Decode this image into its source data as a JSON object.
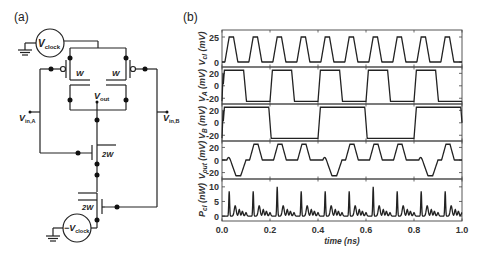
{
  "panel_a": {
    "label": "(a)",
    "source_top": "V",
    "source_top_sub": "clock",
    "source_bottom": "−V",
    "source_bottom_sub": "clock",
    "pmos_left_width": "W",
    "pmos_right_width": "W",
    "output_label": "V",
    "output_sub": "out",
    "input_a": "V",
    "input_a_sub": "in,A",
    "input_b": "V",
    "input_b_sub": "in,B",
    "nmos_top_width": "2W",
    "nmos_bottom_width": "2W"
  },
  "panel_b": {
    "label": "(b)"
  },
  "chart_data": {
    "type": "line",
    "title": "",
    "xlabel": "time  (ns)",
    "xlim": [
      0.0,
      1.0
    ],
    "xticks": [
      "0.0",
      "0.2",
      "0.4",
      "0.6",
      "0.8",
      "1.0"
    ],
    "grid": false,
    "legend": null,
    "subplots": [
      {
        "ylabel": "V_cl (mV)",
        "ylabel_main": "V",
        "ylabel_sub": "cl",
        "ylabel_unit": " (mV)",
        "ylim": [
          -3,
          30
        ],
        "yticks": [
          "0",
          "25"
        ],
        "ytick_values": [
          0,
          25
        ],
        "description": "Clock: square-ish pulses 0 to 25 mV, period 0.1 ns (10 pulses)",
        "x": [
          0.0,
          0.01,
          0.03,
          0.05,
          0.07,
          0.09,
          0.1
        ],
        "values": [
          0,
          0,
          25,
          25,
          0,
          0,
          0
        ],
        "period": 0.1
      },
      {
        "ylabel": "V_A (mV)",
        "ylabel_main": "V",
        "ylabel_sub": "A",
        "ylabel_unit": " (mV)",
        "ylim": [
          -26,
          27
        ],
        "yticks": [
          "20",
          "0",
          "-20"
        ],
        "ytick_values": [
          20,
          0,
          -20
        ],
        "description": "Input A: toggles +25/-25 mV, period 0.2 ns",
        "x": [
          0.0,
          0.01,
          0.09,
          0.11,
          0.19,
          0.2
        ],
        "values": [
          -25,
          25,
          25,
          -25,
          -25,
          -25
        ],
        "period": 0.2
      },
      {
        "ylabel": "V_B (mV)",
        "ylabel_main": "V",
        "ylabel_sub": "B",
        "ylabel_unit": " (mV)",
        "ylim": [
          -26,
          27
        ],
        "yticks": [
          "20",
          "0",
          "-20"
        ],
        "ytick_values": [
          20,
          0,
          -20
        ],
        "description": "Input B: toggles +25/-25 mV, period 0.4 ns",
        "x": [
          0.0,
          0.01,
          0.19,
          0.21,
          0.39,
          0.4
        ],
        "values": [
          -25,
          25,
          25,
          -25,
          -25,
          -25
        ],
        "period": 0.4
      },
      {
        "ylabel": "V_out (mV)",
        "ylabel_main": "V",
        "ylabel_sub": "out",
        "ylabel_unit": " (mV)",
        "ylim": [
          -27,
          27
        ],
        "yticks": [
          "20",
          "0",
          "-20"
        ],
        "ytick_values": [
          20,
          0,
          -20
        ],
        "description": "Output: 0 baseline, one -25 mV dip (A=-,B=-?), three +25 mV pulses per 0.4 ns",
        "x": [
          0.0,
          0.02,
          0.04,
          0.06,
          0.08,
          0.1,
          0.12,
          0.14,
          0.16,
          0.18,
          0.2,
          0.22,
          0.24,
          0.26,
          0.28,
          0.3,
          0.32,
          0.34,
          0.36,
          0.38,
          0.4
        ],
        "values": [
          0,
          0,
          0,
          -25,
          -25,
          0,
          0,
          25,
          25,
          0,
          0,
          25,
          25,
          0,
          0,
          25,
          25,
          0,
          0,
          0,
          0
        ],
        "period": 0.4
      },
      {
        "ylabel": "P_cl (nW)",
        "ylabel_main": "P",
        "ylabel_sub": "cl",
        "ylabel_unit": " (nW)",
        "ylim": [
          -1,
          12
        ],
        "yticks": [
          "10",
          "5",
          "0"
        ],
        "ytick_values": [
          10,
          5,
          0
        ],
        "description": "Clock power: sharp spikes (~8-10 nW) every 0.1 ns followed by small ringing bumps (~1-3.5 nW)",
        "spike_times": [
          0.03,
          0.13,
          0.23,
          0.33,
          0.43,
          0.53,
          0.63,
          0.73,
          0.83,
          0.93
        ],
        "spike_heights": [
          8.5,
          8.5,
          10,
          8.5,
          8.5,
          8.5,
          10,
          8.5,
          8.5,
          8.5
        ]
      }
    ]
  }
}
